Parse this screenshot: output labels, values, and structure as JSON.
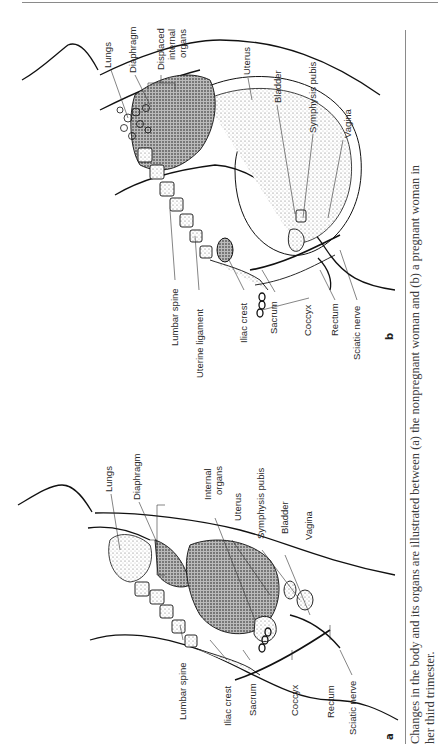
{
  "page": {
    "caption_line1": "Changes in the body and its organs are illustrated between (a) the nonpregnant woman and (b) a pregnant woman in",
    "caption_line2": "her third trimester."
  },
  "figure_b": {
    "panel_label": "b",
    "labels": {
      "lungs": "Lungs",
      "diaphragm": "Diaphragm",
      "displaced_1": "Displaced",
      "displaced_2": "internal",
      "displaced_3": "organs",
      "uterus": "Uterus",
      "bladder": "Bladder",
      "symphysis": "Symphysis pubis",
      "vagina": "Vagina",
      "lumbar_spine": "Lumbar spine",
      "uterine_ligament": "Uterine ligament",
      "iliac_crest": "Iliac crest",
      "sacrum": "Sacrum",
      "coccyx": "Coccyx",
      "rectum": "Rectum",
      "sciatic_nerve": "Sciatic nerve"
    }
  },
  "figure_a": {
    "panel_label": "a",
    "labels": {
      "lungs": "Lungs",
      "diaphragm": "Diaphragm",
      "internal_1": "Internal",
      "internal_2": "organs",
      "uterus": "Uterus",
      "symphysis": "Symphysis pubis",
      "bladder": "Bladder",
      "vagina": "Vagina",
      "lumbar_spine": "Lumbar spine",
      "iliac_crest": "Iliac crest",
      "sacrum": "Sacrum",
      "coccyx": "Coccyx",
      "rectum": "Rectum",
      "sciatic_nerve": "Sciatic nerve"
    }
  }
}
